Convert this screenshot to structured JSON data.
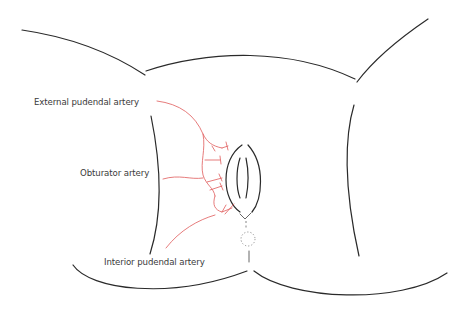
{
  "diagram": {
    "colors": {
      "outline": "#2a2a2a",
      "artery": "#e05a5a",
      "label_text": "#3a3a3a",
      "background": "#ffffff"
    },
    "labels": [
      {
        "id": "external-pudendal",
        "text": "External pudendal artery"
      },
      {
        "id": "obturator",
        "text": "Obturator artery"
      },
      {
        "id": "interior-pudendal",
        "text": "Interior pudendal artery"
      }
    ]
  }
}
